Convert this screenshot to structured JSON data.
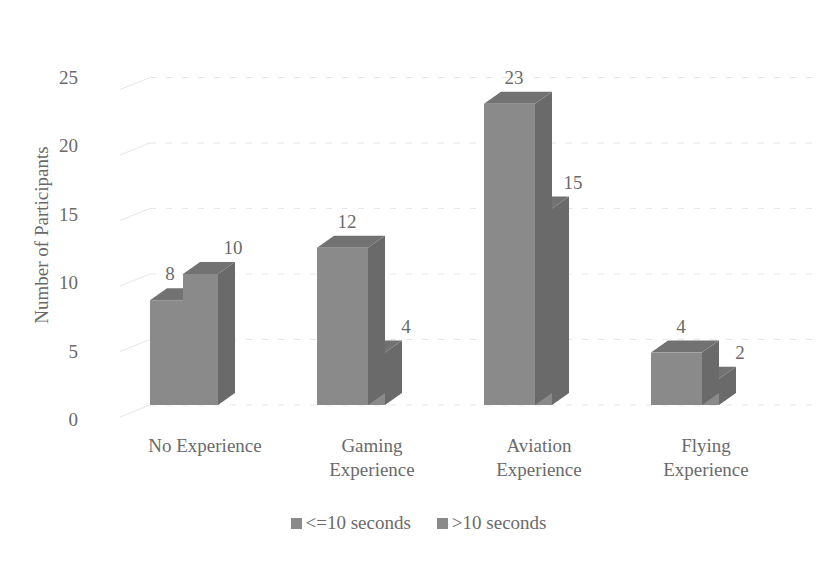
{
  "chart_data": {
    "type": "bar",
    "style": "3d-clustered-column",
    "title": "",
    "xlabel": "",
    "ylabel": "Number of Participants",
    "ylim": [
      0,
      25
    ],
    "yticks": [
      0,
      5,
      10,
      15,
      20,
      25
    ],
    "grid": true,
    "legend_position": "bottom",
    "categories": [
      "No Experience",
      "Gaming Experience",
      "Aviation Experience",
      "Flying Experience"
    ],
    "category_lines": [
      [
        "No Experience"
      ],
      [
        "Gaming",
        "Experience"
      ],
      [
        "Aviation",
        "Experience"
      ],
      [
        "Flying",
        "Experience"
      ]
    ],
    "series": [
      {
        "name": "<=10 seconds",
        "values": [
          8,
          12,
          23,
          4
        ]
      },
      {
        "name": ">10 seconds",
        "values": [
          10,
          4,
          15,
          2
        ]
      }
    ],
    "data_labels": true
  },
  "colors": {
    "front": "#8a8a8a",
    "side": "#6a6a6a",
    "top": "#727272",
    "text": "#6a6a6a",
    "grid": "#e6e6e6"
  },
  "legend": {
    "items": [
      {
        "label": "<=10 seconds"
      },
      {
        "label": ">10 seconds"
      }
    ]
  }
}
